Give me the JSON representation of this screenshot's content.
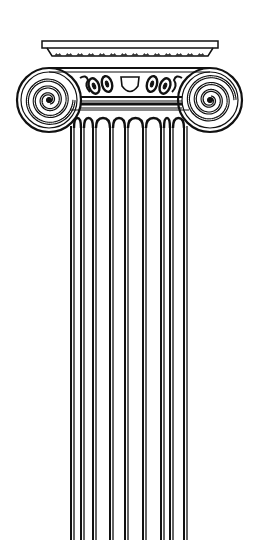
{
  "image": {
    "subject": "Ionic column line drawing",
    "width": 262,
    "height": 540,
    "background": "#ffffff",
    "ink": "#111111"
  },
  "column": {
    "abacus": {
      "x": 42,
      "y": 41,
      "width": 176,
      "height": 7
    },
    "volutes": [
      {
        "side": "left",
        "cx": 49,
        "cy": 100,
        "r": 32
      },
      {
        "side": "right",
        "cx": 210,
        "cy": 100,
        "r": 32
      }
    ],
    "shaft": {
      "x_left": 70,
      "x_right": 189,
      "y_top": 120,
      "y_bottom": 540
    },
    "flute_lines": [
      71,
      74,
      81,
      84,
      93,
      96,
      110,
      113,
      125,
      128,
      143,
      146,
      161,
      164,
      170,
      173,
      184,
      187
    ],
    "flute_count": 8
  }
}
